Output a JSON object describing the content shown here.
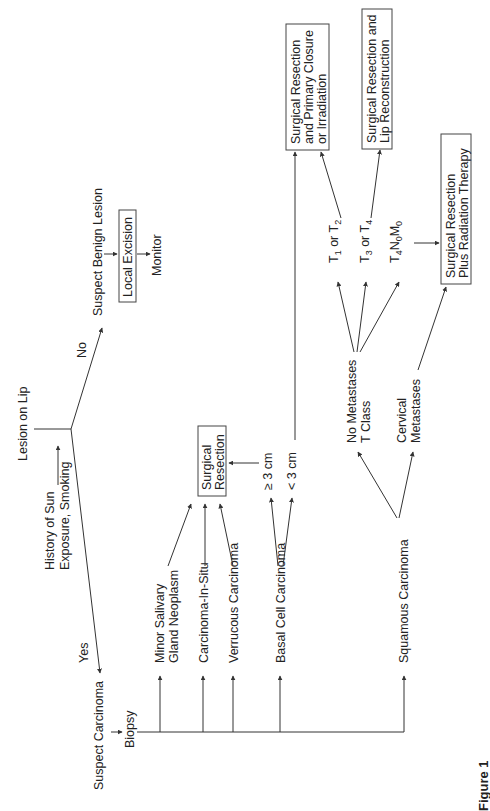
{
  "figure": {
    "caption": "Figure 1",
    "orientation": "rotated 90° counter-clockwise",
    "colors": {
      "line": "#333333",
      "text": "#222222",
      "background": "#ffffff"
    }
  },
  "nodes": {
    "root": "Lesion on Lip",
    "risk_factor_line1": "History of Sun",
    "risk_factor_line2": "Exposure, Smoking",
    "branch_no": "No",
    "branch_yes": "Yes",
    "benign": "Suspect Benign Lesion",
    "local_excision": "Local Excision",
    "monitor": "Monitor",
    "carcinoma": "Suspect Carcinoma",
    "biopsy": "Biopsy",
    "minor_salivary_line1": "Minor Salivary",
    "minor_salivary_line2": "Gland Neoplasm",
    "carcinoma_in_situ": "Carcinoma-In-Situ",
    "verrucous": "Verrucous Carcinoma",
    "basal_cell": "Basal Cell Carcinoma",
    "squamous": "Squamous Carcinoma",
    "surgical_resection_line1": "Surgical",
    "surgical_resection_line2": "Resection",
    "size_ge3": "≥ 3 cm",
    "size_lt3": "< 3 cm",
    "no_metastases_line1": "No Metastases",
    "no_metastases_line2": "T Class",
    "cervical_metastases_line1": "Cervical",
    "cervical_metastases_line2": "Metastases",
    "t1_t2": {
      "a": "T",
      "a_sub": "1",
      "mid": " or T",
      "b_sub": "2"
    },
    "t3_t4": {
      "a": "T",
      "a_sub": "3",
      "mid": " or T",
      "b_sub": "4"
    },
    "t4n0m0": {
      "t": "T",
      "t_sub": "4",
      "n": "N",
      "n_sub": "0",
      "m": "M",
      "m_sub": "0"
    },
    "outcome_primary_line1": "Surgical Resection",
    "outcome_primary_line2": "and Primary Closure",
    "outcome_primary_line3": "or Irradiation",
    "outcome_recon_line1": "Surgical Resection and",
    "outcome_recon_line2": "Lip Reconstruction",
    "outcome_radiation_line1": "Surgical Resection",
    "outcome_radiation_line2": "Plus Radiation Therapy"
  }
}
